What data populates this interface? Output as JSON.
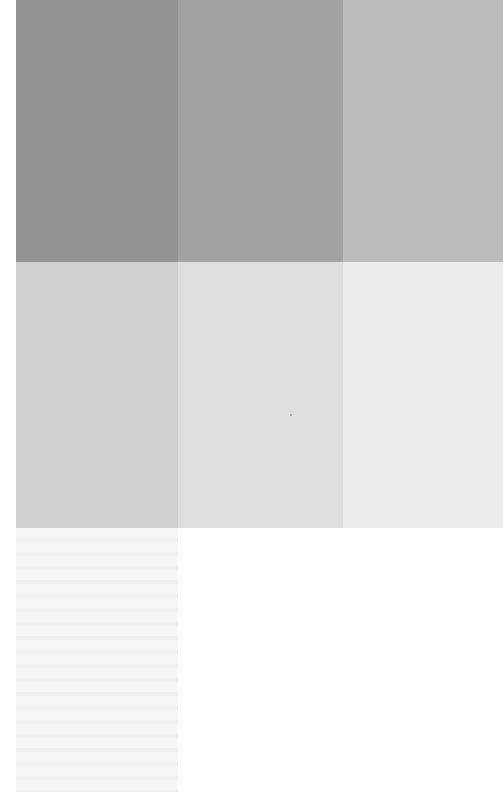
{
  "pattern": {
    "type": "grayscale-swatch-grid",
    "rows": 3,
    "columns": 3,
    "swatches": [
      {
        "row": 0,
        "col": 0,
        "color": "#939393"
      },
      {
        "row": 0,
        "col": 1,
        "color": "#a3a3a3"
      },
      {
        "row": 0,
        "col": 2,
        "color": "#bcbcbc"
      },
      {
        "row": 1,
        "col": 0,
        "color": "#cfcfcf"
      },
      {
        "row": 1,
        "col": 1,
        "color": "#dedede"
      },
      {
        "row": 1,
        "col": 2,
        "color": "#ececec"
      },
      {
        "row": 2,
        "col": 0,
        "color": "#f6f6f6"
      },
      {
        "row": 2,
        "col": 1,
        "color": "#ffffff"
      },
      {
        "row": 2,
        "col": 2,
        "color": "#ffffff"
      }
    ],
    "background": "#ffffff"
  }
}
